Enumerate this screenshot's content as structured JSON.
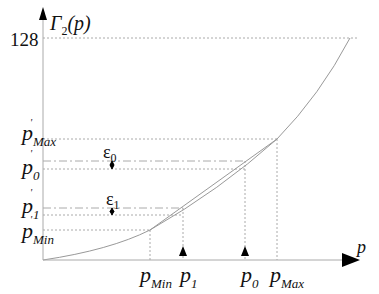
{
  "diagram": {
    "y_axis_label": {
      "main": "Γ",
      "sub": "2",
      "arg": "(p)"
    },
    "x_axis_label": "p",
    "y_tick_top": "128",
    "y_labels": [
      {
        "id": "pmax_prime",
        "base": "p",
        "prime": "'",
        "sub": "Max"
      },
      {
        "id": "p0_prime",
        "base": "p",
        "prime": "'",
        "sub": "0"
      },
      {
        "id": "p1_prime",
        "base": "p",
        "prime": "'",
        "sub": "1"
      },
      {
        "id": "pmin_prime",
        "base": "p",
        "prime": "'",
        "sub": "Min"
      }
    ],
    "x_labels": [
      {
        "id": "pmin",
        "base": "p",
        "sub": "Min"
      },
      {
        "id": "p1",
        "base": "p",
        "sub": "1"
      },
      {
        "id": "p0",
        "base": "p",
        "sub": "0"
      },
      {
        "id": "pmax",
        "base": "p",
        "sub": "Max"
      }
    ],
    "errors": [
      {
        "id": "eps0",
        "base": "ε",
        "sub": "0"
      },
      {
        "id": "eps1",
        "base": "ε",
        "sub": "1"
      }
    ],
    "colors": {
      "curve": "#9a9a9a",
      "guide": "#b0b0b0",
      "axis": "#000000"
    }
  }
}
